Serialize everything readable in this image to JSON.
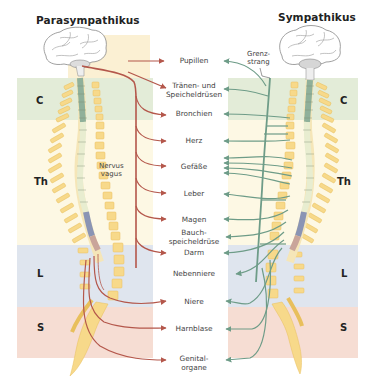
{
  "titles": {
    "left": "Parasympathikus",
    "right": "Sympathikus"
  },
  "regions": [
    {
      "label": "C",
      "color": "#e3ecd8"
    },
    {
      "label": "Th",
      "color": "#fdf8e4"
    },
    {
      "label": "L",
      "color": "#dfe5ee"
    },
    {
      "label": "S",
      "color": "#f6ddd3"
    }
  ],
  "annotations": {
    "vagus_line1": "Nervus",
    "vagus_line2": "vagus",
    "grenz_line1": "Grenz-",
    "grenz_line2": "strang"
  },
  "organs": [
    {
      "line1": "Pupillen",
      "line2": ""
    },
    {
      "line1": "Tränen- und",
      "line2": "Speicheldrüsen"
    },
    {
      "line1": "Bronchien",
      "line2": ""
    },
    {
      "line1": "Herz",
      "line2": ""
    },
    {
      "line1": "Gefäße",
      "line2": ""
    },
    {
      "line1": "Leber",
      "line2": ""
    },
    {
      "line1": "Magen",
      "line2": ""
    },
    {
      "line1": "Bauch-",
      "line2": "speicheldrüse"
    },
    {
      "line1": "Darm",
      "line2": ""
    },
    {
      "line1": "Nebenniere",
      "line2": ""
    },
    {
      "line1": "Niere",
      "line2": ""
    },
    {
      "line1": "Harnblase",
      "line2": ""
    },
    {
      "line1": "Genital-",
      "line2": "organe"
    }
  ],
  "colors": {
    "parasympathetic": "#b4574b",
    "sympathetic": "#6e9c88",
    "vertebra": "#f7d98a",
    "vertebra_stroke": "#e8bf5c",
    "cord_cervical": "#8fb09a",
    "cord_lumbar": "#8a94b4",
    "cord_sacral": "#c9a59a"
  }
}
